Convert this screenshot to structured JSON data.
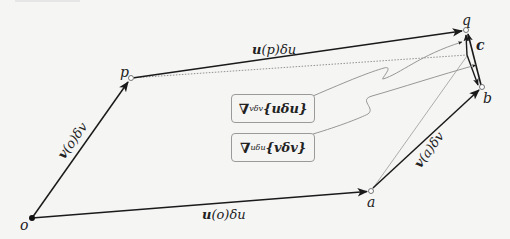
{
  "diagram": {
    "points": {
      "o": {
        "label": "o",
        "x": 32,
        "y": 218,
        "style": "filled"
      },
      "p": {
        "label": "p",
        "x": 131,
        "y": 78,
        "style": "open"
      },
      "a": {
        "label": "a",
        "x": 371,
        "y": 191,
        "style": "open"
      },
      "q": {
        "label": "q",
        "x": 466,
        "y": 30,
        "style": "open"
      },
      "b": {
        "label": "b",
        "x": 482,
        "y": 87,
        "style": "open"
      },
      "c": {
        "label": "c"
      }
    },
    "vectors": {
      "u_o": {
        "label_bold": "u",
        "label_rest": "(o)δu"
      },
      "v_o": {
        "label_bold": "v",
        "label_rest": "(o)δv"
      },
      "u_p": {
        "label_bold": "u",
        "label_rest": "(p)δu"
      },
      "v_a": {
        "label_bold": "v",
        "label_rest": "(a)δv"
      }
    },
    "boxes": [
      {
        "nabla": "∇",
        "subscript": "vδv",
        "argument": "{uδu}"
      },
      {
        "nabla": "∇",
        "subscript": "uδu",
        "argument": "{vδv}"
      }
    ],
    "colors": {
      "background": "#f5f5f4",
      "stroke": "#1a1a1a",
      "light_stroke": "#8c8c8c"
    }
  }
}
